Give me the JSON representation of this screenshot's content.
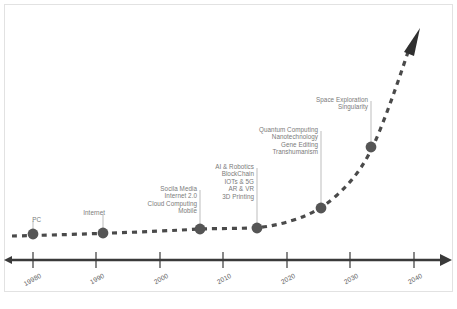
{
  "figure": {
    "background_color": "#ffffff",
    "frame_color": "#e2e2e2",
    "label_color": "#7a7a7a",
    "axis_color": "#3a3a3a",
    "curve_color": "#4a4a4a",
    "marker_color": "#555555"
  },
  "axis": {
    "name": "timeline-axis",
    "ticks": [
      "19980",
      "1990",
      "2000",
      "2010",
      "2020",
      "2030",
      "2040",
      "2050"
    ],
    "tick_years": [
      1980,
      1990,
      2000,
      2010,
      2020,
      2030,
      2040,
      2050
    ],
    "tick_x": [
      33,
      96,
      160,
      223,
      287,
      350,
      414,
      478
    ],
    "y": 260,
    "start_x": 8,
    "end_x": 448
  },
  "milestones": [
    {
      "name": "milestone-pc",
      "dot_x": 33,
      "dot_y": 234,
      "label_x": 41,
      "label_y": 216,
      "leader_top": 221,
      "leader_bottom": 234,
      "items": [
        "PC"
      ]
    },
    {
      "name": "milestone-internet",
      "dot_x": 103,
      "dot_y": 233,
      "label_x": 105,
      "label_y": 209,
      "leader_top": 214,
      "leader_bottom": 233,
      "items": [
        "Internet"
      ]
    },
    {
      "name": "milestone-social-mobile",
      "dot_x": 200,
      "dot_y": 229,
      "label_x": 197,
      "label_y": 185,
      "leader_top": 190,
      "leader_bottom": 229,
      "items": [
        "Socila Media",
        "Internet 2.0",
        "Cloud Computing",
        "Mobile"
      ]
    },
    {
      "name": "milestone-ai-iot",
      "dot_x": 257,
      "dot_y": 228,
      "label_x": 254,
      "label_y": 163,
      "leader_top": 168,
      "leader_bottom": 228,
      "items": [
        "AI & Robotics",
        "BlockChain",
        "IOTs & 5G",
        "AR & VR",
        "3D Printing"
      ]
    },
    {
      "name": "milestone-quantum-nano",
      "dot_x": 321,
      "dot_y": 208,
      "label_x": 318,
      "label_y": 126,
      "leader_top": 131,
      "leader_bottom": 208,
      "items": [
        "Quantum Computing",
        "Nanotechnology",
        "Gene Editing",
        "Transhumanism"
      ]
    },
    {
      "name": "milestone-space-singularity",
      "dot_x": 371,
      "dot_y": 147,
      "label_x": 368,
      "label_y": 96,
      "leader_top": 101,
      "leader_bottom": 147,
      "items": [
        "Space Exploration",
        "Singularity"
      ]
    }
  ],
  "curve": {
    "name": "exponential-growth-curve",
    "style": "dashed",
    "points": [
      [
        12,
        236
      ],
      [
        33,
        234
      ],
      [
        60,
        234
      ],
      [
        103,
        233
      ],
      [
        150,
        231
      ],
      [
        200,
        229
      ],
      [
        230,
        229
      ],
      [
        257,
        228
      ],
      [
        290,
        220
      ],
      [
        321,
        208
      ],
      [
        345,
        185
      ],
      [
        362,
        163
      ],
      [
        371,
        147
      ],
      [
        385,
        115
      ],
      [
        398,
        80
      ],
      [
        408,
        52
      ]
    ],
    "arrow_tip": [
      415,
      33
    ]
  },
  "caption": {
    "text": "",
    "visible": false
  }
}
